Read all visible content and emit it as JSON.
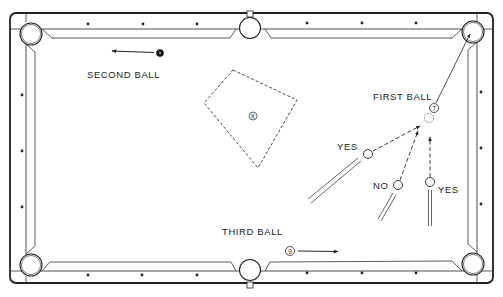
{
  "diagram": {
    "colors": {
      "ink": "#222222",
      "background": "#ffffff"
    },
    "labels": {
      "second_ball": "SECOND BALL",
      "first_ball": "FIRST BALL",
      "third_ball": "THIRD BALL",
      "yes_left": "YES",
      "no": "NO",
      "yes_right": "YES"
    },
    "balls": {
      "first": "7",
      "third": "9",
      "target_zone": "X"
    },
    "cue_positions": [
      {
        "label": "YES",
        "valid": true
      },
      {
        "label": "NO",
        "valid": false
      },
      {
        "label": "YES",
        "valid": true
      }
    ],
    "rail_diamonds": {
      "top": 6,
      "bottom": 6,
      "left": 3,
      "right": 3
    },
    "pockets": [
      "top-left",
      "top-middle",
      "top-right",
      "bottom-left",
      "bottom-middle",
      "bottom-right"
    ]
  }
}
